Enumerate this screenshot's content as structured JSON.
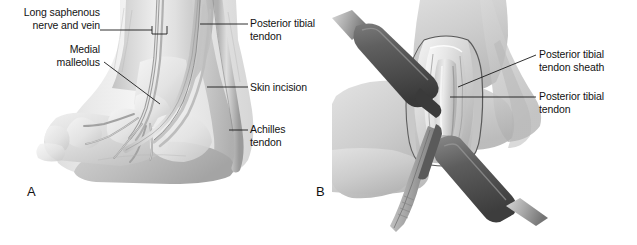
{
  "figure": {
    "background_color": "#ffffff",
    "width": 637,
    "height": 245,
    "line_color": "#1a1a1a",
    "text_color": "#131313"
  },
  "panels": [
    {
      "letter": "A",
      "description": "Medial view of ankle showing surface anatomy landmarks and planned skin incision",
      "labels": [
        {
          "name": "long-saphenous-nerve-and-vein",
          "text": "Long saphenous\nnerve and vein",
          "align": "right"
        },
        {
          "name": "medial-malleolus",
          "text": "Medial\nmalleolus",
          "align": "right"
        },
        {
          "name": "posterior-tibial-tendon",
          "text": "Posterior tibial\ntendon",
          "align": "left"
        },
        {
          "name": "skin-incision",
          "text": "Skin incision",
          "align": "left"
        },
        {
          "name": "achilles-tendon",
          "text": "Achilles\ntendon",
          "align": "left"
        }
      ]
    },
    {
      "letter": "B",
      "description": "Operative exposure with retractors showing opened posterior tibial tendon sheath",
      "labels": [
        {
          "name": "posterior-tibial-tendon-sheath",
          "text": "Posterior tibial\ntendon sheath",
          "align": "left"
        },
        {
          "name": "posterior-tibial-tendon",
          "text": "Posterior tibial\ntendon",
          "align": "left"
        }
      ]
    }
  ],
  "colors": {
    "skin_light": "#e8e8e8",
    "skin_mid": "#cfcfcf",
    "skin_shadow": "#a8a8a8",
    "bone_light": "#f1f1f1",
    "tendon": "#d6d6d6",
    "instrument_dark": "#4e4e4e",
    "instrument_light": "#8f8f8f",
    "outline": "#6b6b6b"
  }
}
